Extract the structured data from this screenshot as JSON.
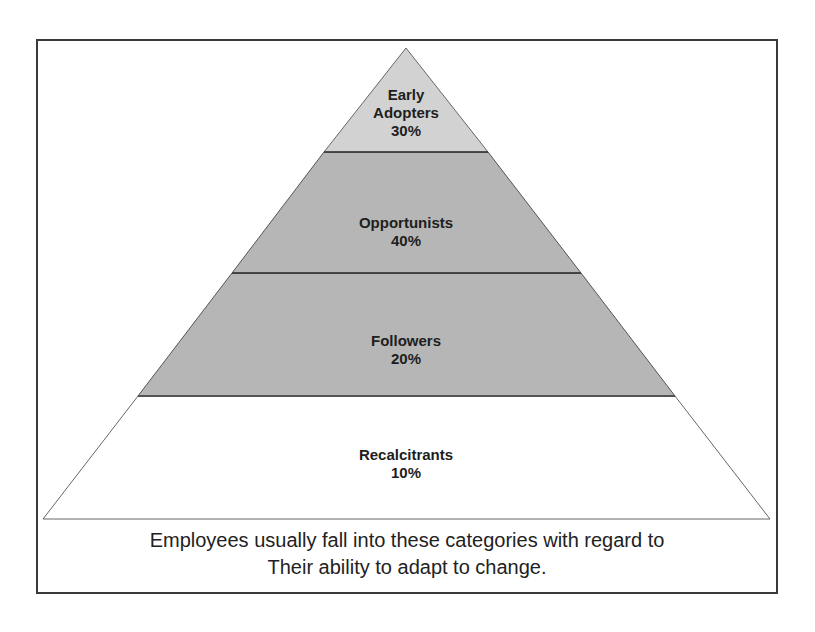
{
  "diagram": {
    "type": "pyramid",
    "tiers": [
      {
        "name": "Early Adopters",
        "line1": "Early",
        "line2": "Adopters",
        "percent": "30%",
        "fill": "#cfcfcf"
      },
      {
        "name": "Opportunists",
        "line1": "Opportunists",
        "percent": "40%",
        "fill": "#b4b4b4"
      },
      {
        "name": "Followers",
        "line1": "Followers",
        "percent": "20%",
        "fill": "#b4b4b4"
      },
      {
        "name": "Recalcitrants",
        "line1": "Recalcitrants",
        "percent": "10%",
        "fill": "#ffffff"
      }
    ],
    "caption": {
      "line1": "Employees usually fall into these categories with regard to",
      "line2": "Their ability to adapt to change."
    },
    "colors": {
      "frame": "#3a3a3a",
      "outline": "#555555",
      "text": "#1e1e1e"
    }
  }
}
